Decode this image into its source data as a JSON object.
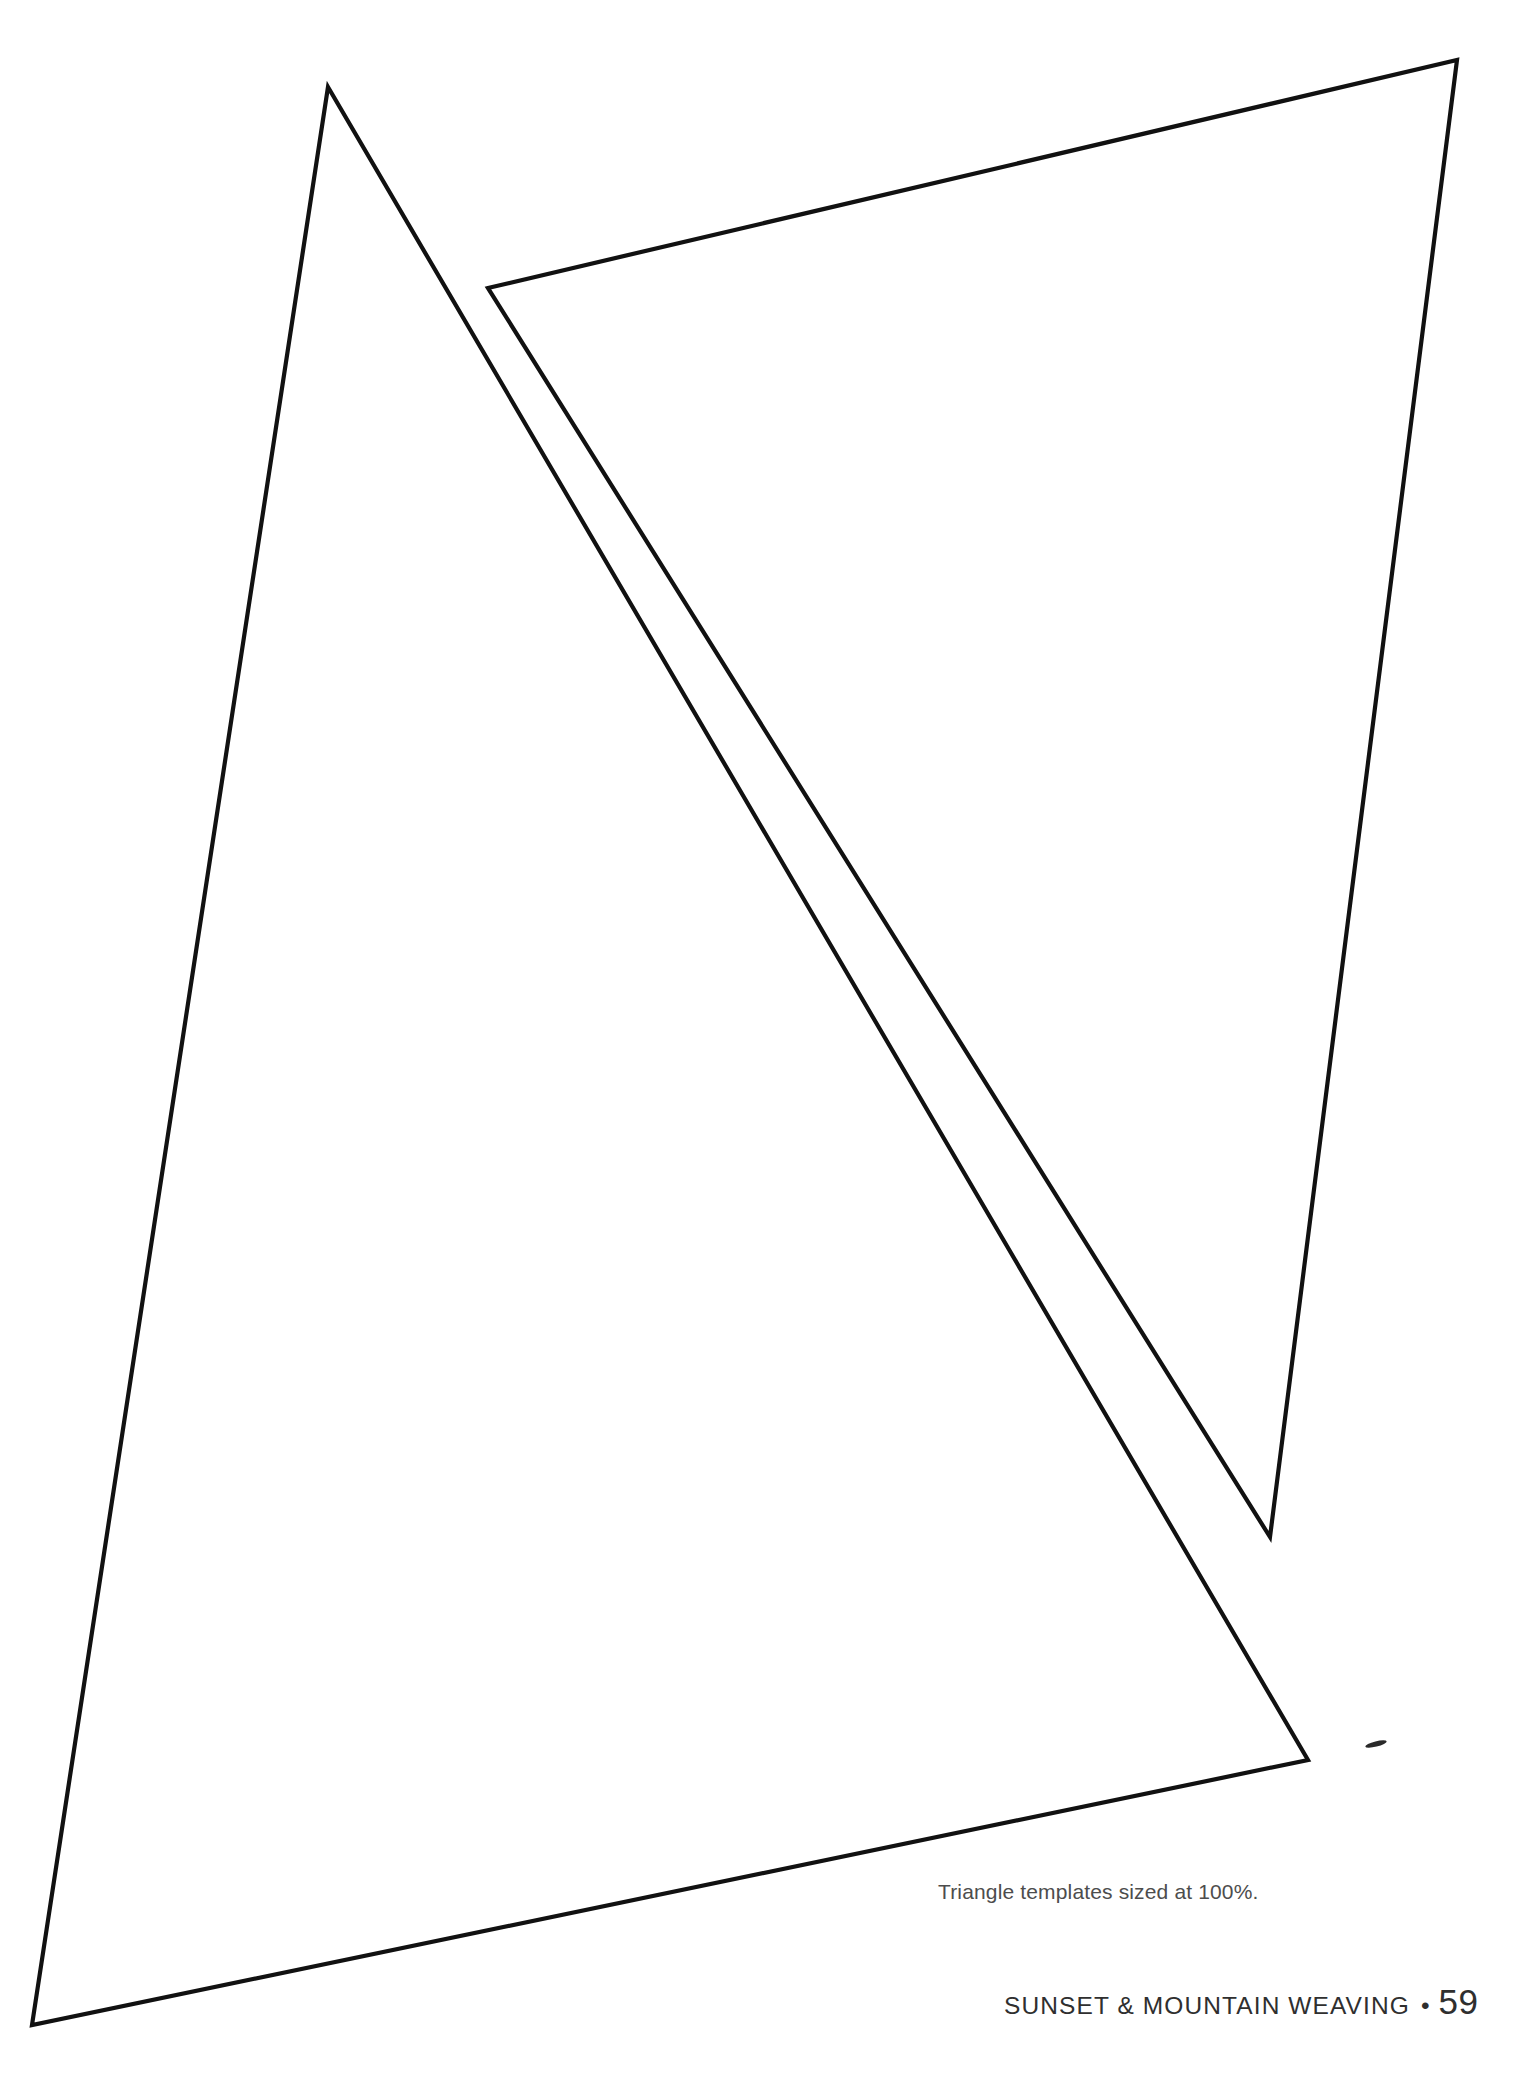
{
  "page": {
    "background_color": "#ffffff",
    "width": 1527,
    "height": 2083
  },
  "caption": {
    "text": "Triangle templates sized at 100%.",
    "color": "#4d4d4d"
  },
  "footer": {
    "title": "SUNSET & MOUNTAIN WEAVING",
    "separator": "•",
    "page_number": "59",
    "color": "#2f2f2f"
  },
  "templates": {
    "stroke_color": "#111111",
    "fill_color": "#ffffff",
    "stroke_width": 4.2,
    "shapes": [
      {
        "name": "large-triangle-template",
        "points": "328,87 1308,1760 32,2025"
      },
      {
        "name": "small-triangle-template",
        "points": "488,288 1457,60 1270,1537"
      }
    ],
    "stray_mark": {
      "name": "stray-ink-mark",
      "cx": 1376,
      "cy": 1744,
      "rx": 11,
      "ry": 2.6,
      "rotate": -14
    }
  }
}
